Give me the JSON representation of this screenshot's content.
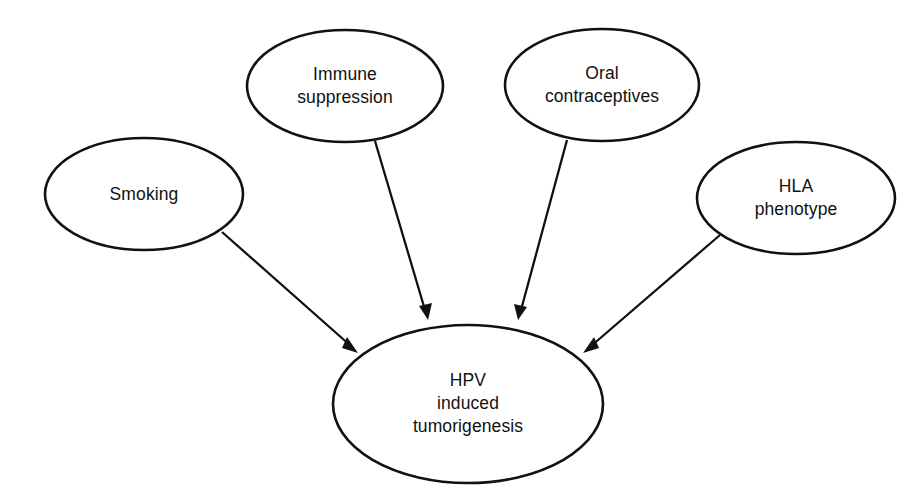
{
  "diagram": {
    "type": "influence-diagram",
    "background_color": "#ffffff",
    "stroke_color": "#111111",
    "nodes": [
      {
        "id": "smoking",
        "label_lines": [
          "Smoking"
        ],
        "line1": "Smoking",
        "line2": "",
        "line3": "",
        "role": "risk-factor",
        "cx": 144,
        "cy": 194,
        "rx": 99,
        "ry": 56
      },
      {
        "id": "immune-suppression",
        "label_lines": [
          "Immune",
          "suppression"
        ],
        "line1": "Immune",
        "line2": "suppression",
        "line3": "",
        "role": "risk-factor",
        "cx": 345,
        "cy": 86,
        "rx": 98,
        "ry": 56
      },
      {
        "id": "oral-contraceptives",
        "label_lines": [
          "Oral",
          "contraceptives"
        ],
        "line1": "Oral",
        "line2": "contraceptives",
        "line3": "",
        "role": "risk-factor",
        "cx": 602,
        "cy": 85,
        "rx": 97,
        "ry": 56
      },
      {
        "id": "hla-phenotype",
        "label_lines": [
          "HLA",
          "phenotype"
        ],
        "line1": "HLA",
        "line2": "phenotype",
        "line3": "",
        "role": "risk-factor",
        "cx": 796,
        "cy": 198,
        "rx": 99,
        "ry": 56
      },
      {
        "id": "hpv-induced-tumorigenesis",
        "label_lines": [
          "HPV",
          "induced",
          "tumorigenesis"
        ],
        "line1": "HPV",
        "line2": "induced",
        "line3": "tumorigenesis",
        "role": "outcome",
        "cx": 468,
        "cy": 404,
        "rx": 135,
        "ry": 79
      }
    ],
    "edges": [
      {
        "id": "edge-smoking",
        "from": "smoking",
        "to": "hpv-induced-tumorigenesis",
        "arrowhead": "filled-triangle"
      },
      {
        "id": "edge-immune-suppression",
        "from": "immune-suppression",
        "to": "hpv-induced-tumorigenesis",
        "arrowhead": "filled-triangle"
      },
      {
        "id": "edge-oral-contraceptives",
        "from": "oral-contraceptives",
        "to": "hpv-induced-tumorigenesis",
        "arrowhead": "filled-triangle"
      },
      {
        "id": "edge-hla-phenotype",
        "from": "hla-phenotype",
        "to": "hpv-induced-tumorigenesis",
        "arrowhead": "filled-triangle"
      }
    ]
  }
}
